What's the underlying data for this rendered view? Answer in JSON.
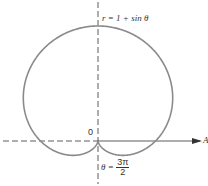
{
  "diagram": {
    "equation_label": "r = 1 + sin θ",
    "origin_label": "0",
    "polar_axis_label": "A",
    "angle_label": {
      "lhs": "θ =",
      "numerator": "3π",
      "denominator": "2"
    },
    "curve": {
      "type": "polar",
      "equation": "r = 1 + sin(theta)",
      "stroke": "#8a8a8a"
    },
    "axes": {
      "stroke": "#333333"
    }
  }
}
